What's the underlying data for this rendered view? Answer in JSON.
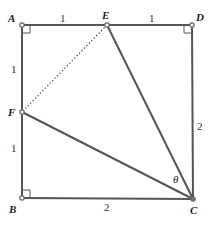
{
  "diagram": {
    "type": "geometry",
    "shape": "square ABCD with side 2",
    "colors": {
      "line": "#555555",
      "point": "#777777",
      "text": "#222222"
    },
    "points": {
      "A": {
        "label": "A",
        "x": 22,
        "y": 25
      },
      "E": {
        "label": "E",
        "x": 107,
        "y": 25
      },
      "D": {
        "label": "D",
        "x": 192,
        "y": 25
      },
      "F": {
        "label": "F",
        "x": 22,
        "y": 112
      },
      "B": {
        "label": "B",
        "x": 22,
        "y": 198
      },
      "C": {
        "label": "C",
        "x": 193,
        "y": 199
      }
    },
    "segment_labels": {
      "AE": "1",
      "ED": "1",
      "AF": "1",
      "FB": "1",
      "BC": "2",
      "DC": "2"
    },
    "angle_label": "θ",
    "right_angles": [
      "A",
      "D",
      "B"
    ],
    "dotted_segment": "EF",
    "solid_segments": [
      "AD",
      "DC",
      "CB",
      "BA",
      "EC",
      "FC"
    ]
  }
}
